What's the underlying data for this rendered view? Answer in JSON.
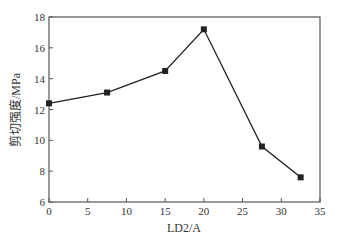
{
  "chart_data": {
    "type": "line",
    "title": "",
    "xlabel": "LD2/A",
    "ylabel": "剪切强度/MPa",
    "xlim": [
      0,
      35
    ],
    "ylim": [
      6,
      18
    ],
    "xticks": [
      0,
      5,
      10,
      15,
      20,
      25,
      30,
      35
    ],
    "yticks": [
      6,
      8,
      10,
      12,
      14,
      16,
      18
    ],
    "grid": false,
    "legend": null,
    "series": [
      {
        "name": "剪切强度",
        "marker": "square",
        "color": "#222222",
        "x": [
          0,
          7.5,
          15,
          20,
          27.5,
          32.5
        ],
        "y": [
          12.4,
          13.1,
          14.5,
          17.2,
          9.6,
          7.6
        ]
      }
    ]
  }
}
